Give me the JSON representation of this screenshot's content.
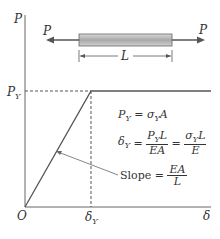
{
  "diagram": {
    "axis_labels": {
      "y": "P",
      "x": "δ",
      "origin": "O"
    },
    "tick_labels": {
      "y_yield": "P_Y",
      "x_yield": "δ_Y"
    },
    "bar": {
      "force_left": "P",
      "force_right": "P",
      "length_label": "L"
    },
    "equations": {
      "eq1": "P_Y = σ_Y A",
      "eq2": "δ_Y = P_Y L / EA = σ_Y L / E",
      "slope": "Slope = EA / L"
    },
    "colors": {
      "line": "#555555",
      "bar_fill": "#b0b0b0"
    }
  }
}
